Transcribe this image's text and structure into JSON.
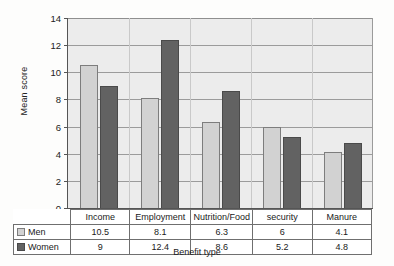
{
  "chart_data": {
    "type": "bar",
    "title": "",
    "xlabel": "Benefit type",
    "ylabel": "Mean score",
    "ylim": [
      0,
      14
    ],
    "ytick_step": 2,
    "yticks": [
      "14",
      "12",
      "10",
      "8",
      "6",
      "4",
      "2",
      "0"
    ],
    "grid": true,
    "legend_position": "table-below",
    "categories": [
      "Income",
      "Employment",
      "Nutrition/Food",
      "security",
      "Manure"
    ],
    "series": [
      {
        "name": "Men",
        "color": "#d2d2d2",
        "values": [
          10.5,
          8.1,
          6.3,
          6,
          4.1
        ],
        "labels": [
          "10.5",
          "8.1",
          "6.3",
          "6",
          "4.1"
        ]
      },
      {
        "name": "Women",
        "color": "#626262",
        "values": [
          9,
          12.4,
          8.6,
          5.2,
          4.8
        ],
        "labels": [
          "9",
          "12.4",
          "8.6",
          "5.2",
          "4.8"
        ]
      }
    ]
  },
  "colors": {
    "men_bar": "#d2d2d2",
    "women_bar": "#626262",
    "plot_background": "#ececec",
    "gridline": "#9b9b9b",
    "axis": "#555555"
  }
}
